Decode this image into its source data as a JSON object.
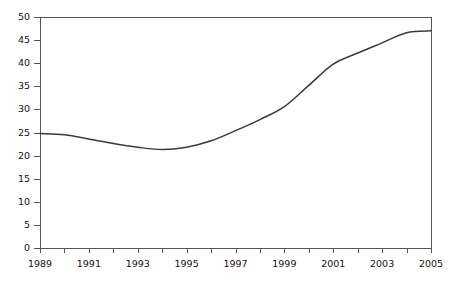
{
  "chart_data": {
    "type": "line",
    "title": "",
    "xlabel": "",
    "ylabel": "",
    "xlim": [
      1989,
      2005
    ],
    "ylim": [
      0,
      50
    ],
    "grid": false,
    "legend": "none",
    "line_color": "#3a3a3a",
    "axis_color": "#555555",
    "background_color": "#ffffff",
    "y_ticks": [
      0,
      5,
      10,
      15,
      20,
      25,
      30,
      35,
      40,
      45,
      50
    ],
    "y_tick_labels": [
      "0",
      "5",
      "10",
      "15",
      "20",
      "25",
      "30",
      "35",
      "40",
      "45",
      "50"
    ],
    "x_ticks": [
      1989,
      1990,
      1991,
      1992,
      1993,
      1994,
      1995,
      1996,
      1997,
      1998,
      1999,
      2000,
      2001,
      2002,
      2003,
      2004,
      2005
    ],
    "x_tick_labels": [
      "1989",
      "",
      "1991",
      "",
      "1993",
      "",
      "1995",
      "",
      "1997",
      "",
      "1999",
      "",
      "2001",
      "",
      "2003",
      "",
      "2005"
    ],
    "x": [
      1989,
      1990,
      1991,
      1992,
      1993,
      1994,
      1995,
      1996,
      1997,
      1998,
      1999,
      2000,
      2001,
      2002,
      2003,
      2004,
      2005
    ],
    "values": [
      24.8,
      24.5,
      23.6,
      22.6,
      21.8,
      21.3,
      21.8,
      23.2,
      25.4,
      27.8,
      30.6,
      35.2,
      39.8,
      42.2,
      44.4,
      46.6,
      47.0
    ],
    "series": [
      {
        "name": "series-1",
        "values": [
          24.8,
          24.5,
          23.6,
          22.6,
          21.8,
          21.3,
          21.8,
          23.2,
          25.4,
          27.8,
          30.6,
          35.2,
          39.8,
          42.2,
          44.4,
          46.6,
          47.0
        ]
      }
    ]
  }
}
